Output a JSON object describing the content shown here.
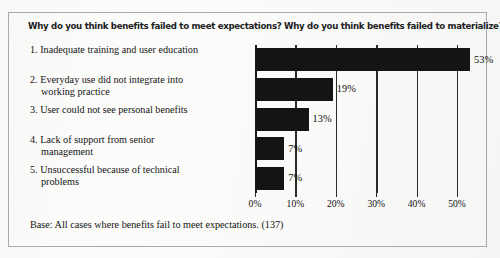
{
  "figure": {
    "title": "Why do you think benefits failed to meet expectations? Why do you think benefits failed to materialize?",
    "base_note": "Base: All cases where benefits fail to meet expectations. (137)"
  },
  "chart_data": {
    "type": "bar",
    "orientation": "horizontal",
    "title": "Why do you think benefits failed to meet expectations? Why do you think benefits failed to materialize?",
    "xlabel": "",
    "ylabel": "",
    "xlim": [
      0,
      50
    ],
    "grid": true,
    "legend": "none",
    "tick_labels": [
      "0%",
      "10%",
      "20%",
      "30%",
      "40%",
      "50%"
    ],
    "tick_values": [
      0,
      10,
      20,
      30,
      40,
      50
    ],
    "categories": [
      "1. Inadequate training and user education",
      "2. Everyday use did not integrate into working practice",
      "3. User could not see personal benefits",
      "4. Lack of support from senior management",
      "5. Unsuccessful because of technical problems"
    ],
    "category_lines": [
      [
        "1. Inadequate training and user",
        "education"
      ],
      [
        "2. Everyday use did not integrate into",
        "working practice"
      ],
      [
        "3. User could not see personal benefits"
      ],
      [
        "4. Lack of support from senior",
        "management"
      ],
      [
        "5. Unsuccessful because of technical",
        "problems"
      ]
    ],
    "values": [
      53,
      19,
      13,
      7,
      7
    ],
    "data_labels": [
      "53%",
      "19%",
      "13%",
      "7%",
      "7%"
    ],
    "bar_color": "#141414",
    "base_note": "Base: All cases where benefits fail to meet expectations. (137)"
  }
}
